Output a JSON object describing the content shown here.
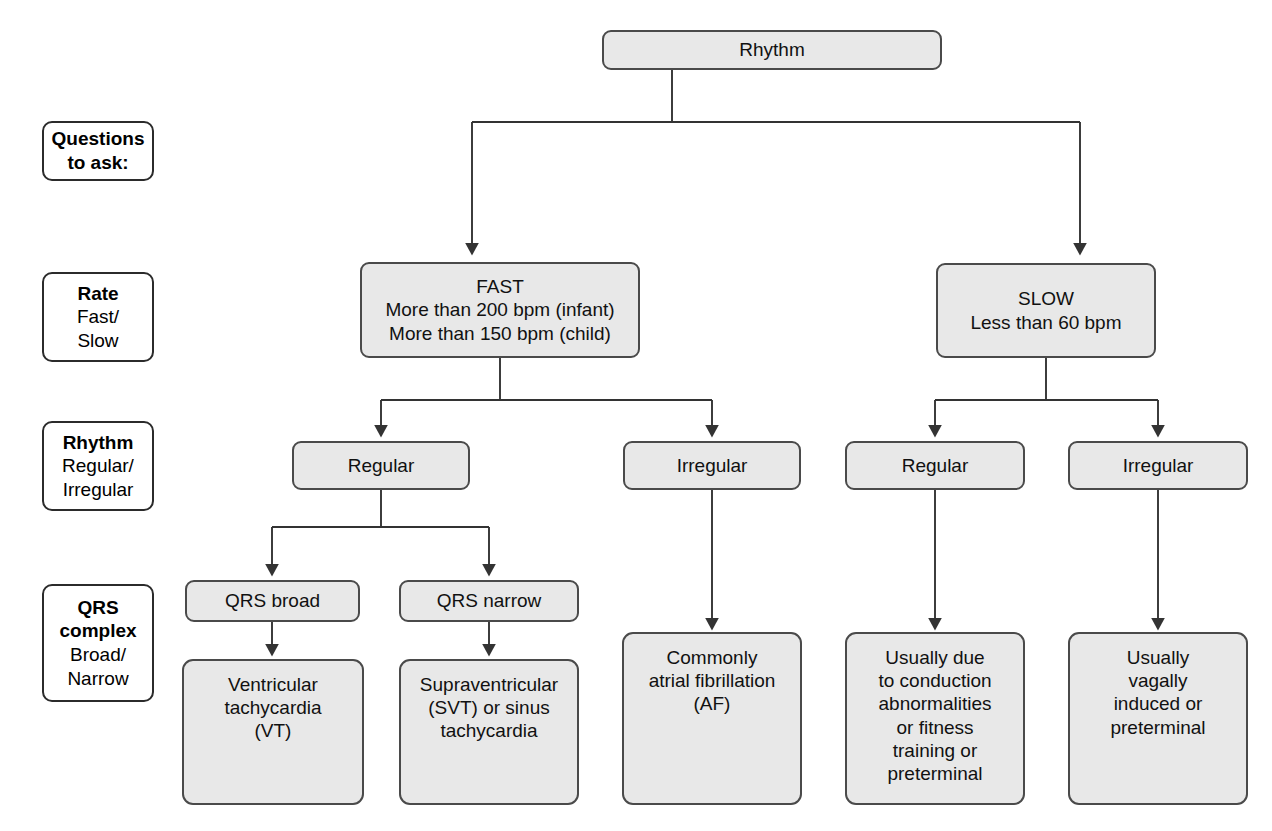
{
  "diagram": {
    "title": "Rhythm",
    "root": {
      "label": "Rhythm"
    },
    "stage_labels": [
      {
        "id": "questions",
        "header": "Questions",
        "line2": "to ask:",
        "line3": "",
        "line4": ""
      },
      {
        "id": "rate",
        "header": "Rate",
        "line2": "Fast/",
        "line3": "Slow",
        "line4": ""
      },
      {
        "id": "rhythm",
        "header": "Rhythm",
        "line2": "Regular/",
        "line3": "Irregular",
        "line4": ""
      },
      {
        "id": "qrs",
        "header": "QRS",
        "header2": "complex",
        "line2": "Broad/",
        "line3": "Narrow",
        "line4": ""
      }
    ],
    "rate_nodes": [
      {
        "id": "fast",
        "label": "FAST\nMore than 200 bpm (infant)\nMore than 150 bpm (child)"
      },
      {
        "id": "slow",
        "label": "SLOW\nLess than 60 bpm"
      }
    ],
    "rhythm_nodes": [
      {
        "id": "fast-regular",
        "label": "Regular"
      },
      {
        "id": "fast-irregular",
        "label": "Irregular"
      },
      {
        "id": "slow-regular",
        "label": "Regular"
      },
      {
        "id": "slow-irregular",
        "label": "Irregular"
      }
    ],
    "qrs_nodes": [
      {
        "id": "qrs-broad",
        "label": "QRS broad"
      },
      {
        "id": "qrs-narrow",
        "label": "QRS narrow"
      }
    ],
    "result_nodes": [
      {
        "id": "vt",
        "label": "Ventricular\ntachycardia\n(VT)"
      },
      {
        "id": "svt",
        "label": "Supraventricular\n(SVT) or sinus\ntachycardia"
      },
      {
        "id": "af",
        "label": "Commonly\natrial fibrillation\n(AF)"
      },
      {
        "id": "conduction",
        "label": "Usually due\nto conduction\nabnormalities\nor fitness\ntraining or\npreterminal"
      },
      {
        "id": "vagal",
        "label": "Usually\nvagally\ninduced or\npreterminal"
      }
    ],
    "colors": {
      "node_fill": "#e8e8e8",
      "node_border": "#4a4a4a",
      "label_border": "#2b2b2b",
      "connector": "#333333",
      "background": "#ffffff"
    }
  }
}
